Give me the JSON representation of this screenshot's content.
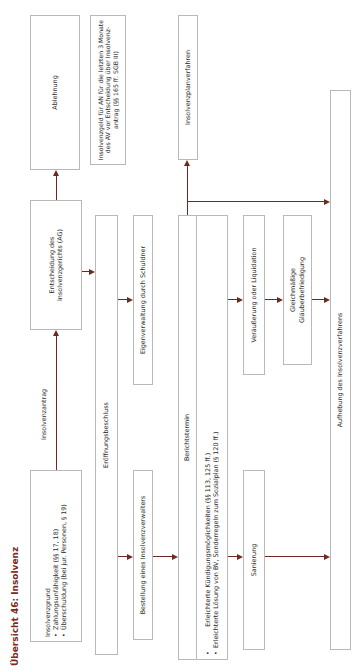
{
  "title": "Übersicht 46: Insolvenz",
  "nodes": {
    "grund": {
      "heading": "Insolvenzgrund",
      "bullets": [
        "Zahlungsunfähigkeit (§§ 17, 18)",
        "Überschuldung (bei jur. Personen, § 19)"
      ]
    },
    "antrag_label": "Insolvenzantrag",
    "entscheidung": "Entscheidung des Insolvenzgerichts (AG)",
    "ablehnung": "Ablehnung",
    "insolvenzgeld": "Insolvenzgeld für AN für die letzten 3 Monate des AV vor Entscheidung über Insolvenz-antrag (§§ 165 ff. SGB III)",
    "eroeffnung": "Eröffnungsbeschluss",
    "bestellung": "Bestellung eines Insolvenzverwalters",
    "eigenverwaltung": "Eigenverwaltung durch Schuldner",
    "berichtstermin": {
      "heading": "Berichtstermin",
      "bullets": [
        "Erleichterte Kündigungsmöglichkeiten (§§ 113, 125 ff.)",
        "Erleichterte Lösung von BV, Sonderregeln zum Sozialplan (§ 120 ff.)"
      ]
    },
    "planverfahren": "Insolvenzplanverfahren",
    "sanierung": "Sanierung",
    "veraeusserung": "Veräußerung oder Liquidation",
    "glaeubiger": "Gleichmäßige Gläuberbefriedigung",
    "aufhebung": "Aufhebung des Insolvenzverfahrens"
  },
  "colors": {
    "accent": "#7a2a1e",
    "arrow": "#6e2a20",
    "border": "#b9b9b9"
  },
  "orientation": "rotated -90deg"
}
